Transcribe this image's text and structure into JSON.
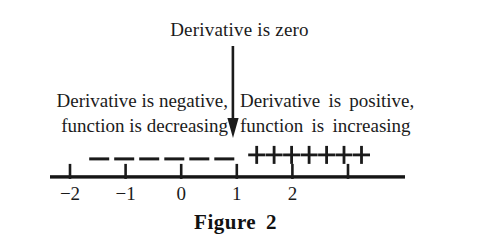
{
  "figure": {
    "caption": "Figure 2",
    "zero_label": "Derivative is zero",
    "background_color": "#ffffff",
    "ink_color": "#1a1a1a"
  },
  "annotations": {
    "negative": {
      "line1": "Derivative is negative,",
      "line2": "function is decreasing"
    },
    "positive": {
      "line1": "Derivative is positive,",
      "line2": "function is increasing"
    }
  },
  "arrow": {
    "name": "down-arrow-icon",
    "points_to": 1,
    "direction": "down"
  },
  "chart_data": {
    "type": "line",
    "title": "Figure 2",
    "xlabel": "",
    "ylabel": "",
    "grid": false,
    "legend": "none",
    "axis": {
      "orientation": "horizontal",
      "xlim": [
        -2.4,
        3.5
      ],
      "ticks": [
        -2,
        -1,
        0,
        1,
        2,
        3
      ],
      "tick_labels": [
        "−2",
        "−1",
        "0",
        "1",
        "2",
        ""
      ]
    },
    "sign_intervals": [
      {
        "name": "negative-sign-region",
        "sign": "−",
        "symbol_count": 6,
        "x_start": -1.7,
        "x_end": 1.0,
        "meaning": "Derivative is negative, function is decreasing"
      },
      {
        "name": "positive-sign-region",
        "sign": "+",
        "symbol_count": 7,
        "x_start": 1.2,
        "x_end": 3.4,
        "meaning": "Derivative is positive, function is increasing"
      }
    ],
    "critical_points": [
      {
        "x": 1,
        "label": "Derivative is zero"
      }
    ]
  }
}
